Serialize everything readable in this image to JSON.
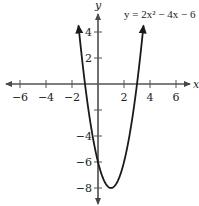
{
  "chart_data": {
    "type": "line",
    "title": "y = 2x² − 4x − 6",
    "equation": "y = 2x² − 4x − 6",
    "xlabel": "x",
    "ylabel": "y",
    "xlim": [
      -7,
      7
    ],
    "ylim": [
      -9,
      6
    ],
    "x_ticks": [
      -6,
      -4,
      -2,
      2,
      4,
      6
    ],
    "y_ticks": [
      4,
      2,
      -2,
      -4,
      -6,
      -8
    ],
    "x_tick_labels": [
      "−6",
      "−4",
      "−2",
      "2",
      "4",
      "6"
    ],
    "y_tick_labels": [
      "4",
      "2",
      "",
      "−4",
      "−6",
      "−8"
    ],
    "grid": false,
    "legend": "none",
    "series": [
      {
        "name": "y = 2x² − 4x − 6",
        "coefficients": {
          "a": 2,
          "b": -4,
          "c": -6
        },
        "vertex": [
          1,
          -8
        ],
        "x_intercepts": [
          -1,
          3
        ],
        "y_intercept": -6,
        "x_range": [
          -1.5,
          3.5
        ],
        "arrows_at_ends": true,
        "color": "#1a1a1a"
      }
    ]
  },
  "style": {
    "axis_color": "#555555",
    "curve_color": "#1a1a1a",
    "text_color": "#222222"
  }
}
